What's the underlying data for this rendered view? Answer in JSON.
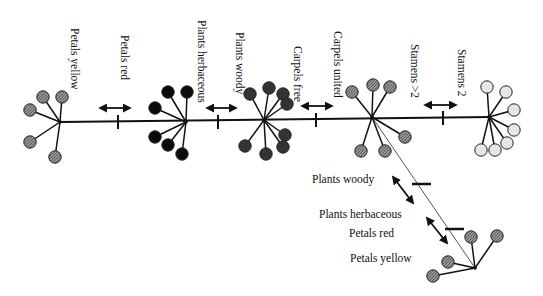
{
  "diagram": {
    "type": "phylogenetic-character-tree",
    "colors": {
      "line": "#111111",
      "thin_branch": "#555555",
      "fill_yellow_hatched": "#6e6e6e",
      "fill_red_black": "#0a0a0a",
      "fill_woody_dark": "#333333",
      "fill_united_hatched": "#777777",
      "fill_stamens2_light": "#e6e6e6"
    },
    "main_axis": {
      "x1": 60,
      "x2": 490,
      "y": 122
    },
    "nodes": [
      {
        "id": "petals-yellow-taxon",
        "cx": 60,
        "cy": 122,
        "fill": "hatched",
        "color": "#6e6e6e",
        "petals": [
          [
            43,
            97
          ],
          [
            62,
            97
          ],
          [
            30,
            110
          ],
          [
            30,
            142
          ],
          [
            55,
            157
          ]
        ]
      },
      {
        "id": "petals-red-taxon",
        "cx": 186,
        "cy": 122,
        "fill": "solid",
        "color": "#0a0a0a",
        "petals": [
          [
            168,
            92
          ],
          [
            187,
            92
          ],
          [
            155,
            108
          ],
          [
            155,
            137
          ],
          [
            168,
            145
          ],
          [
            182,
            154
          ]
        ]
      },
      {
        "id": "plants-woody-taxon",
        "cx": 264,
        "cy": 120,
        "fill": "solid",
        "color": "#333333",
        "petals": [
          [
            250,
            94
          ],
          [
            269,
            88
          ],
          [
            283,
            94
          ],
          [
            287,
            104
          ],
          [
            285,
            135
          ],
          [
            283,
            147
          ],
          [
            266,
            154
          ],
          [
            245,
            146
          ]
        ]
      },
      {
        "id": "carpels-united-taxon",
        "cx": 372,
        "cy": 117,
        "fill": "hatched",
        "color": "#777777",
        "petals": [
          [
            352,
            92
          ],
          [
            373,
            85
          ],
          [
            390,
            87
          ],
          [
            405,
            137
          ],
          [
            361,
            151
          ],
          [
            385,
            151
          ]
        ]
      },
      {
        "id": "stamens-2-taxon",
        "cx": 489,
        "cy": 117,
        "fill": "outline",
        "color": "#e6e6e6",
        "petals": [
          [
            487,
            87
          ],
          [
            506,
            92
          ],
          [
            514,
            110
          ],
          [
            514,
            130
          ],
          [
            507,
            143
          ],
          [
            481,
            150
          ],
          [
            495,
            150
          ]
        ]
      },
      {
        "id": "branch-taxon",
        "cx": 475,
        "cy": 268,
        "fill": "hatched",
        "color": "#777777",
        "petals": [
          [
            471,
            237
          ],
          [
            497,
            236
          ],
          [
            448,
            262
          ],
          [
            433,
            276
          ]
        ]
      }
    ],
    "main_ticks": [
      {
        "x": 118,
        "y": 122
      },
      {
        "x": 218,
        "y": 122
      },
      {
        "x": 316,
        "y": 120
      },
      {
        "x": 443,
        "y": 118
      }
    ],
    "main_arrows": [
      {
        "x1": 100,
        "y1": 108,
        "x2": 130,
        "y2": 108
      },
      {
        "x1": 207,
        "y1": 108,
        "x2": 236,
        "y2": 108
      },
      {
        "x1": 302,
        "y1": 106,
        "x2": 332,
        "y2": 106
      },
      {
        "x1": 425,
        "y1": 105,
        "x2": 456,
        "y2": 105
      }
    ],
    "branch_line": {
      "x1": 372,
      "y1": 117,
      "x2": 475,
      "y2": 268
    },
    "branch_ticks": [
      {
        "x1": 412,
        "y1": 184,
        "x2": 431,
        "y2": 184
      },
      {
        "x1": 445,
        "y1": 229,
        "x2": 464,
        "y2": 229
      }
    ],
    "branch_arrows": [
      {
        "x1": 393,
        "y1": 177,
        "x2": 413,
        "y2": 203
      },
      {
        "x1": 427,
        "y1": 218,
        "x2": 447,
        "y2": 243
      }
    ],
    "labels_vertical": [
      {
        "id": "label-petals-yellow",
        "text": "Petals yellow",
        "x": 71,
        "y": 28
      },
      {
        "id": "label-petals-red",
        "text": "Petals red",
        "x": 121,
        "y": 35
      },
      {
        "id": "label-plants-herbaceous",
        "text": "Plants herbaceous",
        "x": 198,
        "y": 20
      },
      {
        "id": "label-plants-woody",
        "text": "Plants woody",
        "x": 236,
        "y": 32
      },
      {
        "id": "label-carpels-free",
        "text": "Carpels free",
        "x": 294,
        "y": 46
      },
      {
        "id": "label-carpels-united",
        "text": "Carpels united",
        "x": 334,
        "y": 31
      },
      {
        "id": "label-stamens-gt2",
        "text": "Stamens >2",
        "x": 411,
        "y": 44
      },
      {
        "id": "label-stamens-2",
        "text": "Stamens 2",
        "x": 458,
        "y": 49
      }
    ],
    "labels_horizontal": [
      {
        "id": "label-branch-plants-woody",
        "text": "Plants woody",
        "x": 312,
        "y": 183
      },
      {
        "id": "label-branch-plants-herbaceous",
        "text": "Plants herbaceous",
        "x": 319,
        "y": 218
      },
      {
        "id": "label-branch-petals-red",
        "text": "Petals red",
        "x": 349,
        "y": 237
      },
      {
        "id": "label-branch-petals-yellow",
        "text": "Petals yellow",
        "x": 350,
        "y": 262
      }
    ]
  }
}
